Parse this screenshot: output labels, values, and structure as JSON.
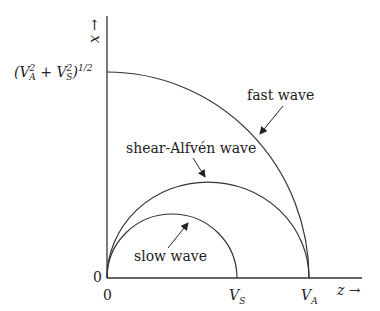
{
  "diagram": {
    "x_axis_label": "z →",
    "y_axis_label": "x →",
    "origin_x_label": "0",
    "origin_y_label": "0",
    "x_ticks": [
      {
        "main": "V",
        "sub": "S"
      },
      {
        "main": "V",
        "sub": "A"
      }
    ],
    "y_tick": {
      "text": "(V",
      "sub1": "A",
      "sup1": "2",
      "plus": " + V",
      "sub2": "S",
      "sup2": "2",
      "tail": ")",
      "exp": "1/2"
    },
    "curves": [
      {
        "name": "fast wave",
        "label": "fast wave"
      },
      {
        "name": "shear-Alfvén wave",
        "label": "shear-Alfvén wave"
      },
      {
        "name": "slow wave",
        "label": "slow wave"
      }
    ],
    "colors": {
      "line": "#333333",
      "text": "#222222"
    }
  }
}
